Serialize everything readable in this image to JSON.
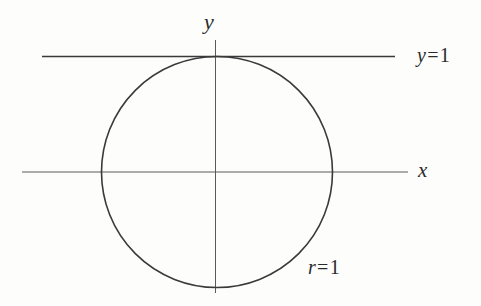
{
  "figure": {
    "background_color": "#fdfdfc",
    "ink_color": "#2b2b2b",
    "axis_color": "#555555",
    "width": 481,
    "height": 306
  },
  "labels": {
    "y_axis": {
      "text": "y",
      "variable": "y"
    },
    "x_axis": {
      "text": "x",
      "variable": "x"
    },
    "line_y_equals_1": {
      "text": "y = 1",
      "variable": "y",
      "operator": "=",
      "value": "1"
    },
    "circle_r_equals_1": {
      "text": "r = 1",
      "variable": "r",
      "operator": "=",
      "value": "1"
    }
  },
  "chart_data": {
    "type": "line",
    "title": "",
    "xlabel": "x",
    "ylabel": "y",
    "grid": false,
    "legend": null,
    "xlim": [
      -1.7,
      1.7
    ],
    "ylim": [
      -1.0,
      1.15
    ],
    "annotations": [
      {
        "text": "y",
        "role": "axis-label",
        "x": 0.0,
        "y": 1.3
      },
      {
        "text": "x",
        "role": "axis-label",
        "x": 1.8,
        "y": 0.0
      },
      {
        "text": "y = 1",
        "role": "curve-label",
        "x": 1.78,
        "y": 1.0
      },
      {
        "text": "r = 1",
        "role": "curve-label",
        "x": 0.82,
        "y": -0.83
      }
    ],
    "series": [
      {
        "name": "r = 1",
        "type": "circle",
        "center": [
          0,
          0
        ],
        "radius": 1,
        "equation": "x^2 + y^2 = 1"
      },
      {
        "name": "y = 1",
        "type": "horizontal-line",
        "y": 1,
        "equation": "y = 1",
        "x_range": [
          -1.5,
          1.55
        ]
      },
      {
        "name": "x-axis",
        "type": "horizontal-line",
        "y": 0,
        "x_range": [
          -1.68,
          1.65
        ]
      },
      {
        "name": "y-axis",
        "type": "vertical-line",
        "x": 0,
        "y_range": [
          -1.04,
          1.14
        ]
      }
    ],
    "tangency_point": [
      0,
      1
    ]
  },
  "geometry": {
    "circle": {
      "cx": 217,
      "cy": 172,
      "r": 115.5
    },
    "x_axis": {
      "x1": 22,
      "y1": 172,
      "x2": 408,
      "y2": 172
    },
    "y_axis": {
      "x1": 215.5,
      "y1": 40,
      "x2": 215.5,
      "y2": 293
    },
    "line_y1": {
      "x1": 42,
      "y1": 56.5,
      "x2": 395,
      "y2": 56.5
    }
  }
}
